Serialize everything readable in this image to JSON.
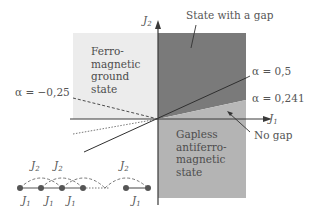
{
  "axes": {
    "x_label": "J",
    "x_label_sub": "1",
    "y_label": "J",
    "y_label_sub": "2"
  },
  "regions": {
    "ferromagnetic": [
      "Ferro-",
      "magnetic",
      "ground",
      "state"
    ],
    "gapped": "State with a gap",
    "gapless": [
      "Gapless",
      "antiferro-",
      "magnetic",
      "state"
    ],
    "no_gap": "No gap"
  },
  "lines": {
    "alpha_neg": "α = −0,25",
    "alpha_half": "α = 0,5",
    "alpha_241": "α = 0,241"
  },
  "chain": {
    "j2_labels": [
      "J",
      "J",
      "J"
    ],
    "j2_sub": "2",
    "j1_labels": [
      "J",
      "J",
      "J",
      "J"
    ],
    "j1_sub": "1"
  },
  "colors": {
    "dark_region": "#7a7a7a",
    "mid_region": "#b4b4b4",
    "light_region": "#ececec",
    "axis": "#3a3a3a"
  }
}
